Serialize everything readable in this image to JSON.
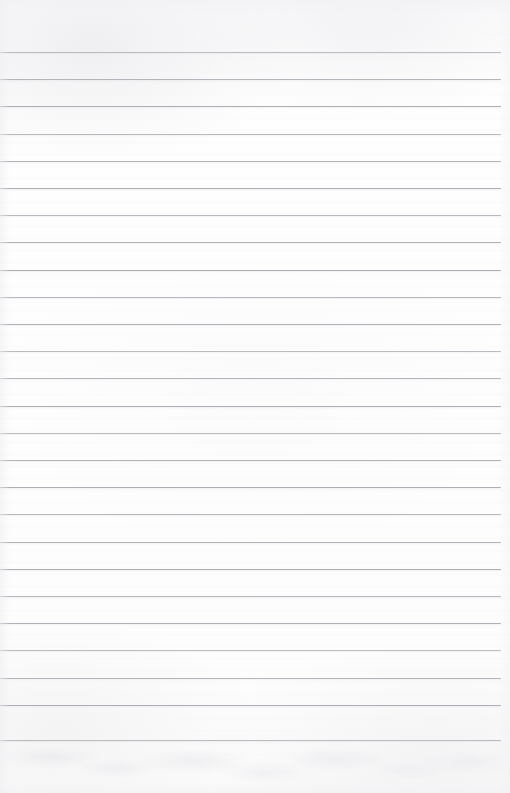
{
  "document": {
    "kind": "ruled-notebook-paper-scan",
    "description": "Blank lined paper sheet, no handwriting or printed text",
    "width_px": 510,
    "height_px": 793
  },
  "paper": {
    "background_color": "#fdfdfd",
    "grain_tint_color": "#f2f2f5",
    "edge_vignette_color": "#eeeef1"
  },
  "ruling": {
    "line_color": "#a9a9b0",
    "line_thickness_px": 1,
    "line_spacing_px": 27.2,
    "first_line_y_px": 52,
    "last_line_y_px": 740,
    "line_start_x_px": 0,
    "line_end_x_px": 501,
    "line_count": 26,
    "line_y_positions": [
      52,
      79.2,
      106.4,
      133.6,
      160.8,
      188,
      215.2,
      242.4,
      269.6,
      296.8,
      324,
      351.2,
      378.4,
      405.6,
      432.8,
      460,
      487.2,
      514.4,
      541.6,
      568.8,
      596,
      623.2,
      650.4,
      677.6,
      704.8,
      740
    ]
  },
  "margins": {
    "top_blank_px": 52,
    "bottom_blank_px": 53,
    "right_blank_px": 9,
    "left_blank_px": 0
  },
  "bleed_through": {
    "region_top_px": 742,
    "region_height_px": 51,
    "tint_color": "#e8e8ec"
  },
  "content": {
    "text_present": false,
    "handwriting_present": false,
    "header_text": "",
    "body_text": ""
  }
}
